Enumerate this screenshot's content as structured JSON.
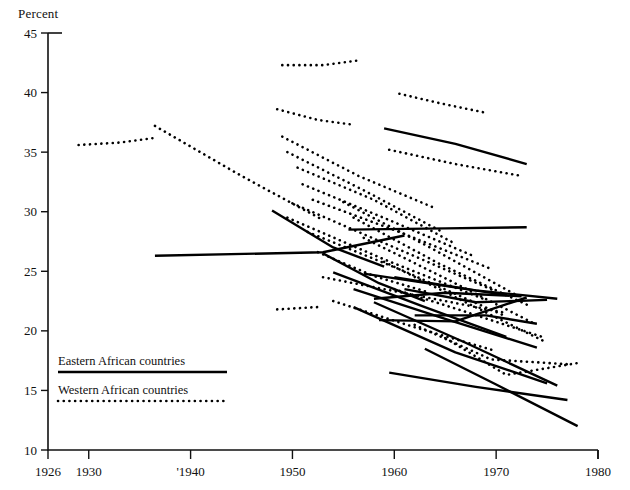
{
  "chart_data": {
    "type": "line",
    "title": "",
    "subtitle": "",
    "ylabel": "Percent",
    "xlabel": "",
    "ylim": [
      10,
      45
    ],
    "xlim": [
      1926,
      1980
    ],
    "ytick_values": [
      10,
      15,
      20,
      25,
      30,
      35,
      40,
      45
    ],
    "ytick_labels": [
      "10",
      "15",
      "20",
      "25",
      "30",
      "35",
      "40",
      "45"
    ],
    "xtick_values": [
      1926,
      1930,
      1940,
      1950,
      1960,
      1970,
      1980
    ],
    "xtick_labels": [
      "1926",
      "1930",
      "'1940",
      "1950",
      "1960",
      "1970",
      "1980"
    ],
    "grid": false,
    "legend_position": "lower-left",
    "legend": [
      {
        "label": "Eastern African countries",
        "style": "solid"
      },
      {
        "label": "Western African countries",
        "style": "dotted"
      }
    ],
    "series": [
      {
        "name": "eastern-1",
        "group": "Eastern African countries",
        "style": "solid",
        "x": [
          1936.5,
          1953.0,
          1961.0
        ],
        "y": [
          26.3,
          26.6,
          28.0
        ]
      },
      {
        "name": "eastern-2",
        "group": "Eastern African countries",
        "style": "solid",
        "x": [
          1948.0,
          1954.0,
          1959.0
        ],
        "y": [
          30.1,
          27.0,
          25.4
        ]
      },
      {
        "name": "eastern-3",
        "group": "Eastern African countries",
        "style": "solid",
        "x": [
          1953.0,
          1958.5,
          1963.0
        ],
        "y": [
          26.5,
          24.0,
          22.5
        ]
      },
      {
        "name": "eastern-4",
        "group": "Eastern African countries",
        "style": "solid",
        "x": [
          1959.0,
          1966.0,
          1973.0
        ],
        "y": [
          37.0,
          35.7,
          34.0
        ]
      },
      {
        "name": "eastern-5",
        "group": "Eastern African countries",
        "style": "solid",
        "x": [
          1955.5,
          1965.0,
          1973.0
        ],
        "y": [
          28.5,
          28.6,
          28.7
        ]
      },
      {
        "name": "eastern-6",
        "group": "Eastern African countries",
        "style": "solid",
        "x": [
          1957.0,
          1964.0,
          1971.0
        ],
        "y": [
          24.8,
          23.9,
          23.0
        ]
      },
      {
        "name": "eastern-7",
        "group": "Eastern African countries",
        "style": "solid",
        "x": [
          1958.0,
          1965.0,
          1972.5
        ],
        "y": [
          22.7,
          23.2,
          22.9
        ]
      },
      {
        "name": "eastern-8",
        "group": "Eastern African countries",
        "style": "solid",
        "x": [
          1958.5,
          1966.0,
          1973.0
        ],
        "y": [
          20.9,
          20.8,
          22.8
        ]
      },
      {
        "name": "eastern-9",
        "group": "Eastern African countries",
        "style": "solid",
        "x": [
          1954.0,
          1963.0,
          1971.0
        ],
        "y": [
          24.9,
          22.0,
          19.5
        ]
      },
      {
        "name": "eastern-10",
        "group": "Eastern African countries",
        "style": "solid",
        "x": [
          1956.0,
          1965.0,
          1974.0
        ],
        "y": [
          23.5,
          21.0,
          18.6
        ]
      },
      {
        "name": "eastern-11",
        "group": "Eastern African countries",
        "style": "solid",
        "x": [
          1958.0,
          1967.0,
          1976.0
        ],
        "y": [
          22.4,
          19.0,
          15.4
        ]
      },
      {
        "name": "eastern-12",
        "group": "Eastern African countries",
        "style": "solid",
        "x": [
          1956.0,
          1966.0,
          1975.0
        ],
        "y": [
          22.0,
          18.2,
          15.6
        ]
      },
      {
        "name": "eastern-13",
        "group": "Eastern African countries",
        "style": "solid",
        "x": [
          1959.5,
          1968.0,
          1977.0
        ],
        "y": [
          16.5,
          15.3,
          14.2
        ]
      },
      {
        "name": "eastern-14",
        "group": "Eastern African countries",
        "style": "solid",
        "x": [
          1963.0,
          1970.0,
          1978.0
        ],
        "y": [
          18.5,
          15.5,
          12.0
        ]
      },
      {
        "name": "eastern-15",
        "group": "Eastern African countries",
        "style": "solid",
        "x": [
          1961.0,
          1968.0,
          1975.0
        ],
        "y": [
          23.5,
          22.4,
          22.6
        ]
      },
      {
        "name": "eastern-16",
        "group": "Eastern African countries",
        "style": "solid",
        "x": [
          1960.0,
          1968.0,
          1976.0
        ],
        "y": [
          24.5,
          23.4,
          22.7
        ]
      },
      {
        "name": "eastern-17",
        "group": "Eastern African countries",
        "style": "solid",
        "x": [
          1962.0,
          1969.0,
          1974.0
        ],
        "y": [
          21.3,
          21.3,
          20.6
        ]
      },
      {
        "name": "western-1",
        "group": "Western African countries",
        "style": "dotted",
        "x": [
          1929.0,
          1933.0,
          1936.5
        ],
        "y": [
          35.6,
          35.8,
          36.2
        ]
      },
      {
        "name": "western-2",
        "group": "Western African countries",
        "style": "dotted",
        "x": [
          1936.5,
          1945.0,
          1953.0
        ],
        "y": [
          37.2,
          33.0,
          29.3
        ]
      },
      {
        "name": "western-3",
        "group": "Western African countries",
        "style": "dotted",
        "x": [
          1949.0,
          1953.0,
          1956.5
        ],
        "y": [
          42.3,
          42.3,
          42.7
        ]
      },
      {
        "name": "western-4",
        "group": "Western African countries",
        "style": "dotted",
        "x": [
          1948.5,
          1952.5,
          1956.0
        ],
        "y": [
          38.6,
          37.7,
          37.3
        ]
      },
      {
        "name": "western-5",
        "group": "Western African countries",
        "style": "dotted",
        "x": [
          1960.5,
          1964.5,
          1969.0
        ],
        "y": [
          39.9,
          39.1,
          38.3
        ]
      },
      {
        "name": "western-6",
        "group": "Western African countries",
        "style": "dotted",
        "x": [
          1959.5,
          1966.0,
          1972.5
        ],
        "y": [
          35.2,
          34.0,
          33.0
        ]
      },
      {
        "name": "western-7",
        "group": "Western African countries",
        "style": "dotted",
        "x": [
          1949.0,
          1956.5,
          1964.0
        ],
        "y": [
          36.3,
          33.0,
          30.3
        ]
      },
      {
        "name": "western-8",
        "group": "Western African countries",
        "style": "dotted",
        "x": [
          1949.5,
          1957.0,
          1964.5
        ],
        "y": [
          35.0,
          31.8,
          28.4
        ]
      },
      {
        "name": "western-9",
        "group": "Western African countries",
        "style": "dotted",
        "x": [
          1950.5,
          1958.0,
          1966.0
        ],
        "y": [
          33.7,
          31.0,
          27.3
        ]
      },
      {
        "name": "western-10",
        "group": "Western African countries",
        "style": "dotted",
        "x": [
          1951.0,
          1959.5,
          1968.0
        ],
        "y": [
          32.3,
          29.3,
          26.2
        ]
      },
      {
        "name": "western-11",
        "group": "Western African countries",
        "style": "dotted",
        "x": [
          1952.0,
          1960.5,
          1969.5
        ],
        "y": [
          31.0,
          28.3,
          25.2
        ]
      },
      {
        "name": "western-12",
        "group": "Western African countries",
        "style": "dotted",
        "x": [
          1950.0,
          1960.0,
          1970.0
        ],
        "y": [
          30.7,
          27.0,
          23.3
        ]
      },
      {
        "name": "western-13",
        "group": "Western African countries",
        "style": "dotted",
        "x": [
          1949.5,
          1959.0,
          1969.0
        ],
        "y": [
          29.5,
          26.0,
          22.6
        ]
      },
      {
        "name": "western-14",
        "group": "Western African countries",
        "style": "dotted",
        "x": [
          1951.5,
          1961.0,
          1971.0
        ],
        "y": [
          28.3,
          25.0,
          21.2
        ]
      },
      {
        "name": "western-15",
        "group": "Western African countries",
        "style": "dotted",
        "x": [
          1955.0,
          1963.5,
          1972.0
        ],
        "y": [
          30.8,
          27.0,
          23.0
        ]
      },
      {
        "name": "western-16",
        "group": "Western African countries",
        "style": "dotted",
        "x": [
          1956.0,
          1964.5,
          1973.0
        ],
        "y": [
          29.5,
          25.6,
          22.2
        ]
      },
      {
        "name": "western-17",
        "group": "Western African countries",
        "style": "dotted",
        "x": [
          1957.0,
          1965.5,
          1974.0
        ],
        "y": [
          27.8,
          24.2,
          20.5
        ]
      },
      {
        "name": "western-18",
        "group": "Western African countries",
        "style": "dotted",
        "x": [
          1953.0,
          1962.0,
          1971.0
        ],
        "y": [
          24.5,
          23.0,
          21.5
        ]
      },
      {
        "name": "western-19",
        "group": "Western African countries",
        "style": "dotted",
        "x": [
          1948.5,
          1950.5,
          1952.5
        ],
        "y": [
          21.8,
          21.9,
          22.0
        ]
      },
      {
        "name": "western-20",
        "group": "Western African countries",
        "style": "dotted",
        "x": [
          1954.0,
          1962.0,
          1970.0
        ],
        "y": [
          22.5,
          20.3,
          18.3
        ]
      },
      {
        "name": "western-21",
        "group": "Western African countries",
        "style": "dotted",
        "x": [
          1959.0,
          1967.0,
          1975.0
        ],
        "y": [
          25.8,
          22.4,
          19.0
        ]
      },
      {
        "name": "western-22",
        "group": "Western African countries",
        "style": "dotted",
        "x": [
          1962.0,
          1969.5,
          1977.0
        ],
        "y": [
          20.5,
          17.6,
          17.2
        ]
      },
      {
        "name": "western-23",
        "group": "Western African countries",
        "style": "dotted",
        "x": [
          1965.0,
          1971.0,
          1978.0
        ],
        "y": [
          19.4,
          16.3,
          17.3
        ]
      },
      {
        "name": "western-24",
        "group": "Western African countries",
        "style": "dotted",
        "x": [
          1952.5,
          1958.0,
          1963.5
        ],
        "y": [
          26.6,
          24.6,
          23.2
        ]
      },
      {
        "name": "western-25",
        "group": "Western African countries",
        "style": "dotted",
        "x": [
          1960.0,
          1967.0,
          1974.5
        ],
        "y": [
          23.5,
          21.6,
          19.5
        ]
      }
    ]
  }
}
